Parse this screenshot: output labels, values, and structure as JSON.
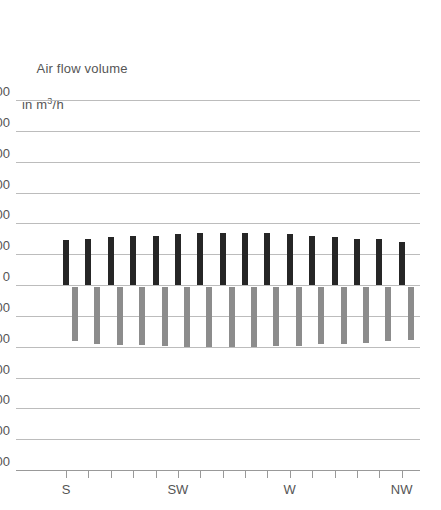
{
  "chart_data": {
    "type": "bar",
    "title_line1": "Air flow volume",
    "title_line2_prefix": "in m",
    "title_line2_sup": "3",
    "title_line2_suffix": "/h",
    "xlabel": "",
    "ylabel": "Air flow volume in m³/h",
    "ylim": [
      -1200,
      1200
    ],
    "ytick_step": 200,
    "yticks": [
      1200,
      1000,
      800,
      600,
      400,
      200,
      0,
      -200,
      -400,
      -600,
      -800,
      -1000,
      -1200
    ],
    "ytick_labels": [
      "1200",
      "1000",
      "800",
      "600",
      "400",
      "200",
      "0",
      "-200",
      "-400",
      "-600",
      "-800",
      "-1000",
      "-1200"
    ],
    "grid": true,
    "legend": false,
    "xtick_count": 16,
    "x_named_ticks": [
      {
        "index": 0,
        "label": "S"
      },
      {
        "index": 5,
        "label": "SW"
      },
      {
        "index": 10,
        "label": "W"
      },
      {
        "index": 15,
        "label": "NW"
      }
    ],
    "categories": [
      "S",
      "",
      "",
      "",
      "",
      "SW",
      "",
      "",
      "",
      "",
      "W",
      "",
      "",
      "",
      "",
      "NW"
    ],
    "series": [
      {
        "name": "supply",
        "color": "#262626",
        "values": [
          290,
          300,
          310,
          315,
          320,
          330,
          335,
          340,
          340,
          340,
          330,
          320,
          310,
          300,
          300,
          280
        ]
      },
      {
        "name": "extract",
        "color": "#8c8c8c",
        "values": [
          -365,
          -380,
          -390,
          -390,
          -395,
          -400,
          -405,
          -405,
          -400,
          -395,
          -395,
          -385,
          -380,
          -375,
          -365,
          -355
        ]
      }
    ]
  }
}
